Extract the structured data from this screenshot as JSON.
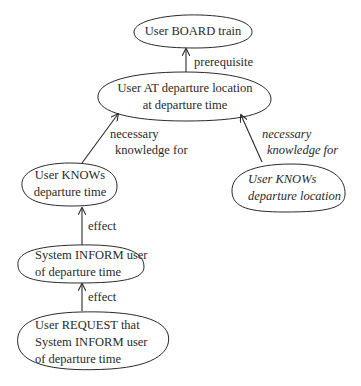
{
  "diagram": {
    "nodes": {
      "board": {
        "lines": [
          "User BOARD train"
        ]
      },
      "at": {
        "lines": [
          "User AT departure location",
          "at departure time"
        ]
      },
      "knows_time": {
        "lines": [
          "User KNOWs",
          "departure time"
        ]
      },
      "knows_location": {
        "lines": [
          "User KNOWs",
          "departure location"
        ]
      },
      "inform": {
        "lines": [
          "System INFORM user",
          "of departure time"
        ]
      },
      "request": {
        "lines": [
          "User REQUEST that",
          "System INFORM user",
          "of departure time"
        ]
      }
    },
    "edges": {
      "prerequisite": {
        "lines": [
          "prerequisite"
        ],
        "from": "at",
        "to": "board"
      },
      "nk_time": {
        "lines": [
          "necessary",
          "knowledge for"
        ],
        "from": "knows_time",
        "to": "at"
      },
      "nk_location": {
        "lines": [
          "necessary",
          "knowledge for"
        ],
        "from": "knows_location",
        "to": "at"
      },
      "effect_inform": {
        "lines": [
          "effect"
        ],
        "from": "inform",
        "to": "knows_time"
      },
      "effect_request": {
        "lines": [
          "effect"
        ],
        "from": "request",
        "to": "inform"
      }
    },
    "colors": {
      "ink": "#2a2a2a",
      "background": "#ffffff"
    }
  }
}
